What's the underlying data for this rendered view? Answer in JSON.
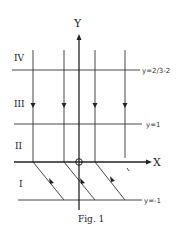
{
  "figure": {
    "caption": "Fig. 1",
    "axes": {
      "x_label": "X",
      "y_label": "Y"
    },
    "line_labels": {
      "top": "y=2/3-2",
      "middle": "y=1",
      "bottom": "y=-1"
    },
    "regions": {
      "r4": "IV",
      "r3": "III",
      "r2": "II",
      "r1": "I"
    },
    "colors": {
      "ink": "#222222",
      "background": "#ffffff"
    }
  }
}
